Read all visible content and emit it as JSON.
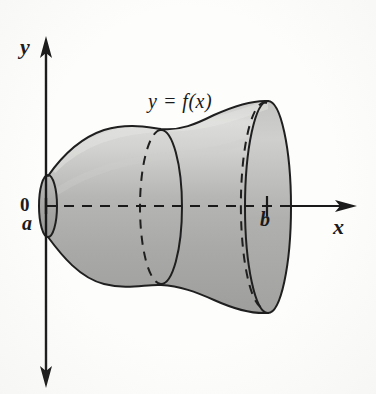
{
  "figure": {
    "background_color": "#fdfdfc",
    "ink_color": "#1a1a1a"
  },
  "axes": {
    "y_axis": {
      "label": "y",
      "orientation": "vertical",
      "arrow_both_ends": true,
      "x_position_px": 46,
      "top_px": 38,
      "bottom_px": 386
    },
    "x_axis": {
      "label": "x",
      "orientation": "horizontal",
      "style": "dashed-inside-solid-outside",
      "y_position_px": 206,
      "left_px": 46,
      "right_px": 356
    },
    "origin_label": "0"
  },
  "marks": [
    {
      "name": "lower-limit",
      "label": "a",
      "x_px": 46,
      "description": "left endpoint of interval, on the y-axis"
    },
    {
      "name": "upper-limit",
      "label": "b",
      "x_px": 267,
      "description": "tick mark on x-axis inside the solid"
    }
  ],
  "curve_label": {
    "text": "y = f(x)",
    "x_px": 148,
    "y_px": 90
  },
  "solid": {
    "type": "surface-of-revolution",
    "axis_of_revolution": "x-axis",
    "fill_top_color": "#dcdcdc",
    "fill_mid_color": "#b4b4b4",
    "fill_bottom_color": "#a0a09e",
    "outline_color": "#1f1f1f",
    "left_cap": {
      "center_x_px": 48,
      "center_y_px": 206,
      "rx_px": 9,
      "ry_px": 31
    },
    "middle_disk": {
      "center_x_px": 161,
      "center_y_px": 207,
      "rx_px": 21,
      "ry_px": 77,
      "front_half": "solid",
      "back_half": "dashed"
    },
    "right_hidden_ellipse": {
      "center_x_px": 250,
      "center_y_px": 207,
      "rx_px": 22,
      "ry_px": 96,
      "style": "dashed"
    },
    "right_cap": {
      "center_x_px": 268,
      "center_y_px": 207,
      "rx_px": 23,
      "ry_px": 106
    }
  },
  "profile_points": {
    "description": "Upper boundary radius of the solid as a function of x (pixel coords)",
    "x": [
      48,
      70,
      95,
      120,
      145,
      161,
      185,
      210,
      235,
      250,
      260,
      268
    ],
    "y_top": [
      176,
      148,
      134,
      128,
      126,
      130,
      124,
      116,
      110,
      106,
      102,
      101
    ],
    "y_bottom": [
      237,
      266,
      281,
      287,
      289,
      285,
      291,
      298,
      304,
      308,
      312,
      313
    ]
  }
}
